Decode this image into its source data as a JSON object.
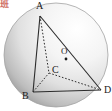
{
  "figure": {
    "type": "solid-geometry-diagram",
    "width": 112,
    "height": 111,
    "background_color": "#ffffff"
  },
  "sphere": {
    "name": "sphere",
    "center": {
      "x": 56,
      "y": 55
    },
    "radius": 52,
    "outline_color": "#9a9a9a",
    "fill_light": "#fdfdfd",
    "fill_mid": "#e2e2e2",
    "fill_shadow": "#9e9e9e",
    "highlight": {
      "x": 78,
      "y": 28
    }
  },
  "vertices": [
    {
      "id": "A",
      "label": "A",
      "x": 40,
      "y": 16,
      "label_x": 36,
      "label_y": 1
    },
    {
      "id": "B",
      "label": "B",
      "x": 33,
      "y": 92,
      "label_x": 22,
      "label_y": 91
    },
    {
      "id": "C",
      "label": "C",
      "x": 49,
      "y": 73,
      "label_x": 52,
      "label_y": 65
    },
    {
      "id": "D",
      "label": "D",
      "x": 101,
      "y": 90,
      "label_x": 104,
      "label_y": 85
    }
  ],
  "center_point": {
    "id": "O",
    "label": "O",
    "x": 66,
    "y": 59,
    "label_x": 61,
    "label_y": 47,
    "marker_color": "#1a1a1a",
    "marker_radius": 1.4
  },
  "edges": [
    {
      "id": "AB",
      "from": "A",
      "to": "B",
      "style": "solid",
      "color": "#2b2b2b"
    },
    {
      "id": "AD",
      "from": "A",
      "to": "D",
      "style": "solid",
      "color": "#2b2b2b"
    },
    {
      "id": "BD",
      "from": "B",
      "to": "D",
      "style": "solid",
      "color": "#2b2b2b"
    },
    {
      "id": "AC",
      "from": "A",
      "to": "C",
      "style": "dashed",
      "color": "#2b2b2b"
    },
    {
      "id": "BC",
      "from": "B",
      "to": "C",
      "style": "dashed",
      "color": "#2b2b2b"
    },
    {
      "id": "CD",
      "from": "C",
      "to": "D",
      "style": "dashed",
      "color": "#2b2b2b"
    }
  ],
  "watermark": {
    "text": "班",
    "x": 13,
    "y": 59,
    "color": "#c0392b"
  }
}
